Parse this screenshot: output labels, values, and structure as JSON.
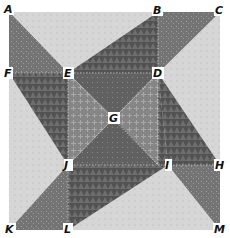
{
  "diagram": {
    "colors": {
      "background_light": "#d4d4d4",
      "dark_blade": "#5a5a5a",
      "medium_blade": "#7a7a7a",
      "center_cross": "#8c8c8c",
      "center_dark": "#6a6a6a",
      "label_text": "#111111",
      "label_bg": "#ffffff"
    },
    "points": {
      "A": {
        "label": "A",
        "x": 9,
        "y": 12
      },
      "B": {
        "label": "B",
        "x": 158,
        "y": 12
      },
      "C": {
        "label": "C",
        "x": 220,
        "y": 12
      },
      "F": {
        "label": "F",
        "x": 9,
        "y": 73
      },
      "E": {
        "label": "E",
        "x": 68,
        "y": 73
      },
      "D": {
        "label": "D",
        "x": 158,
        "y": 73
      },
      "G": {
        "label": "G",
        "x": 114,
        "y": 118
      },
      "J": {
        "label": "J",
        "x": 68,
        "y": 165
      },
      "I": {
        "label": "I",
        "x": 168,
        "y": 165
      },
      "H": {
        "label": "H",
        "x": 220,
        "y": 165
      },
      "K": {
        "label": "K",
        "x": 9,
        "y": 230
      },
      "L": {
        "label": "L",
        "x": 68,
        "y": 230
      },
      "M": {
        "label": "M",
        "x": 220,
        "y": 230
      }
    },
    "regions": [
      {
        "name": "outer-square",
        "vertices": [
          "A",
          "C",
          "M",
          "K"
        ],
        "shade": "background_light"
      },
      {
        "name": "left-dark-blade",
        "vertices": [
          "A",
          "E",
          "J",
          "F"
        ],
        "shade": "dark_blade"
      },
      {
        "name": "top-dark-blade",
        "vertices": [
          "E",
          "B",
          "D"
        ],
        "shade": "dark_blade"
      },
      {
        "name": "top-medium-triangle",
        "vertices": [
          "B",
          "C",
          "D"
        ],
        "shade": "medium_blade"
      },
      {
        "name": "right-dark-blade",
        "vertices": [
          "D",
          "H",
          "I"
        ],
        "shade": "dark_blade"
      },
      {
        "name": "right-medium-triangle",
        "vertices": [
          "H",
          "M",
          "I"
        ],
        "shade": "medium_blade"
      },
      {
        "name": "bottom-dark-blade",
        "vertices": [
          "I",
          "L",
          "J"
        ],
        "shade": "dark_blade"
      },
      {
        "name": "bottom-medium-triangle",
        "vertices": [
          "L",
          "K",
          "J"
        ],
        "shade": "medium_blade"
      },
      {
        "name": "center-top-triangle",
        "vertices": [
          "E",
          "D",
          "G"
        ],
        "shade": "center_dark"
      },
      {
        "name": "center-right-triangle",
        "vertices": [
          "D",
          "I",
          "G"
        ],
        "shade": "center_cross"
      },
      {
        "name": "center-bottom-triangle",
        "vertices": [
          "I",
          "J",
          "G"
        ],
        "shade": "center_dark"
      },
      {
        "name": "center-left-triangle",
        "vertices": [
          "J",
          "E",
          "G"
        ],
        "shade": "center_cross"
      }
    ]
  }
}
